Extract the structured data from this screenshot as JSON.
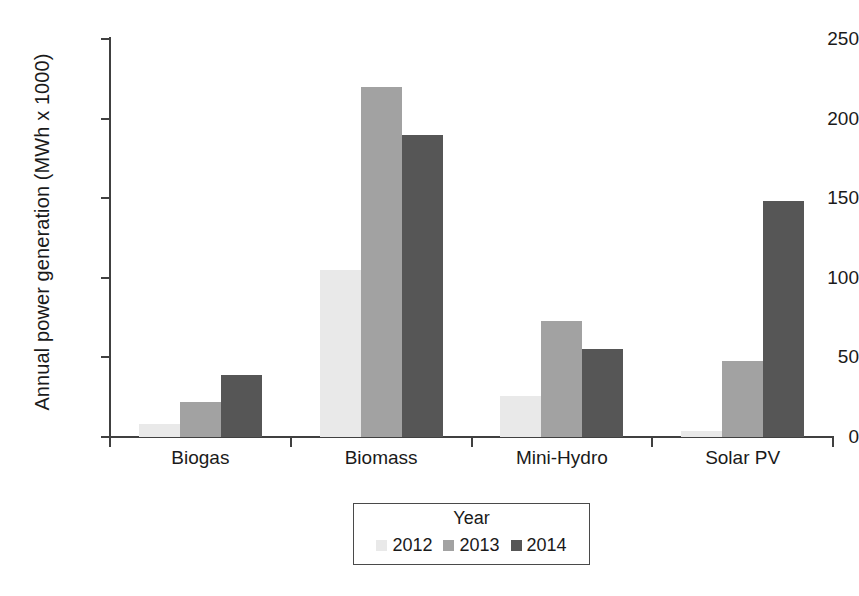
{
  "chart_data": {
    "type": "bar",
    "title": "",
    "xlabel": "",
    "ylabel": "Annual power generation (MWh x 1000)",
    "categories": [
      "Biogas",
      "Biomass",
      "Mini-Hydro",
      "Solar PV"
    ],
    "series": [
      {
        "name": "2012",
        "color": "#e9e9e9",
        "values": [
          8,
          105,
          26,
          4
        ]
      },
      {
        "name": "2013",
        "color": "#a2a2a2",
        "values": [
          22,
          220,
          73,
          48
        ]
      },
      {
        "name": "2014",
        "color": "#565656",
        "values": [
          39,
          190,
          55,
          148
        ]
      }
    ],
    "ylim": [
      0,
      250
    ],
    "yticks": [
      0,
      50,
      100,
      150,
      200,
      250
    ],
    "ytick_labels": [
      "0",
      "50",
      "100",
      "150",
      "200",
      "250"
    ],
    "grid": false,
    "legend": {
      "title": "Year",
      "position": "bottom-center",
      "entries": [
        "2012",
        "2013",
        "2014"
      ]
    }
  },
  "axis": {
    "y_title": "Annual power generation (MWh x 1000)"
  },
  "legend": {
    "title": "Year"
  }
}
